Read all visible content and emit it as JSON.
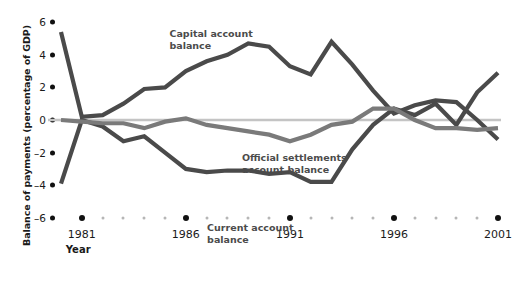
{
  "chart_data": {
    "type": "line",
    "title": "",
    "subtitle": "",
    "xlabel": "Year",
    "ylabel": "Balance of payments (percentage of GDP)",
    "xlim": [
      1980,
      2001
    ],
    "ylim": [
      -6,
      6
    ],
    "ytick_labels": [
      "6",
      "4",
      "2",
      "0",
      "–2",
      "–4",
      "–6"
    ],
    "ytick_values": [
      6,
      4,
      2,
      0,
      -2,
      -4,
      -6
    ],
    "xtick_labels": [
      "1981",
      "1986",
      "1991",
      "1996",
      "2001"
    ],
    "xtick_values": [
      1981,
      1986,
      1991,
      1996,
      2001
    ],
    "x": [
      1980,
      1981,
      1982,
      1983,
      1984,
      1985,
      1986,
      1987,
      1988,
      1989,
      1990,
      1991,
      1992,
      1993,
      1994,
      1995,
      1996,
      1997,
      1998,
      1999,
      2000,
      2001
    ],
    "grid": false,
    "zero_line": true,
    "legend_position": "inline-annotations",
    "series": [
      {
        "name": "Capital account balance",
        "color": "#4a4a4a",
        "values": [
          5.4,
          0.2,
          0.3,
          1.0,
          1.9,
          2.0,
          3.0,
          3.6,
          4.0,
          4.7,
          4.5,
          3.3,
          2.8,
          4.8,
          3.4,
          1.8,
          0.4,
          0.9,
          1.2,
          1.1,
          0.0,
          -1.2
        ]
      },
      {
        "name": "Current account balance",
        "color": "#4a4a4a",
        "values": [
          -3.9,
          0.0,
          -0.4,
          -1.3,
          -1.0,
          -2.0,
          -3.0,
          -3.2,
          -3.1,
          -3.1,
          -3.3,
          -3.2,
          -3.8,
          -3.8,
          -1.8,
          -0.3,
          0.7,
          0.3,
          1.0,
          -0.3,
          1.7,
          2.9
        ]
      },
      {
        "name": "Official settlements account balance",
        "color": "#7a7a7a",
        "values": [
          0.0,
          -0.1,
          -0.2,
          -0.2,
          -0.5,
          -0.1,
          0.1,
          -0.3,
          -0.5,
          -0.7,
          -0.9,
          -1.3,
          -0.9,
          -0.3,
          -0.1,
          0.7,
          0.7,
          0.0,
          -0.5,
          -0.5,
          -0.6,
          -0.5
        ]
      }
    ],
    "annotations": [
      {
        "text": "Capital account\nbalance",
        "series": "Capital account balance"
      },
      {
        "text": "Official settlements\naccount balance",
        "series": "Official settlements account balance"
      },
      {
        "text": "Current account\nbalance",
        "series": "Current account balance"
      }
    ],
    "colors": {
      "line_dark": "#4a4a4a",
      "line_mid": "#7a7a7a",
      "zero_line": "#c4c4c4",
      "tick_dot": "#111111",
      "minor_dot": "#b6b6b6",
      "text": "#1a1a1a",
      "annotation_text": "#4b4b4b",
      "background": "#ffffff"
    }
  }
}
